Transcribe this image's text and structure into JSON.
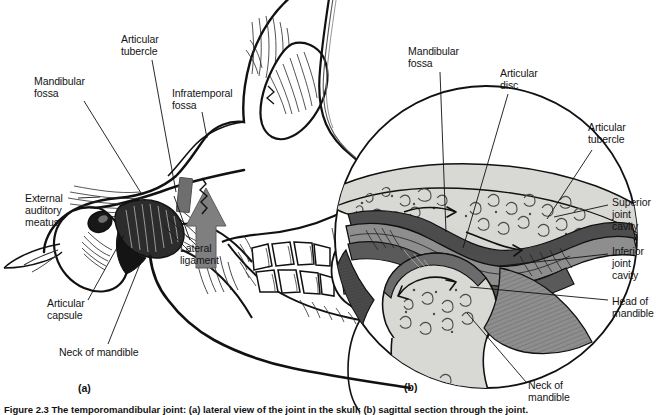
{
  "figure": {
    "caption": "Figure 2.3  The temporomandibular joint: (a) lateral view of the joint in the skull; (b) sagittal section through the joint.",
    "panels": [
      {
        "id": "(a)",
        "name": "lateral-view-of-temporomandibular-joint",
        "id_x": 78,
        "id_y": 382,
        "labels": [
          {
            "text": "Articular\ntubercle",
            "x": 121,
            "y": 34,
            "leader": [
              [
                152,
                60
              ],
              [
                176,
                192
              ]
            ]
          },
          {
            "text": "Mandibular\nfossa",
            "x": 34,
            "y": 76,
            "leader": [
              [
                84,
                101
              ],
              [
                141,
                193
              ]
            ]
          },
          {
            "text": "Infratemporal\nfossa",
            "x": 172,
            "y": 88,
            "leader": [
              [
                202,
                112
              ],
              [
                207,
                138
              ]
            ]
          },
          {
            "text": "External\nauditory\nmeatus",
            "x": 25,
            "y": 193,
            "leader": [
              [
                78,
                198
              ],
              [
                100,
                197
              ]
            ]
          },
          {
            "text": "Lateral\nligament",
            "x": 180,
            "y": 243,
            "leader": [
              [
                190,
                240
              ],
              [
                174,
                196
              ]
            ]
          },
          {
            "text": "Articular\ncapsule",
            "x": 47,
            "y": 298,
            "leader": [
              [
                88,
                300
              ],
              [
                124,
                235
              ]
            ]
          },
          {
            "text": "Neck of mandible",
            "x": 59,
            "y": 347,
            "leader": [
              [
                108,
                344
              ],
              [
                144,
                254
              ]
            ]
          }
        ],
        "arrow": {
          "name": "upward-direction-arrow",
          "color": "#7f7f7f"
        },
        "shaded_block": {
          "name": "lateral-ligament-marker-block",
          "color": "#6e6e6e"
        }
      },
      {
        "id": "(b)",
        "name": "sagittal-section-through-joint",
        "id_x": 404,
        "id_y": 381,
        "labels": [
          {
            "text": "Mandibular\nfossa",
            "x": 408,
            "y": 46,
            "leader": [
              [
                440,
                72
              ],
              [
                446,
                232
              ]
            ]
          },
          {
            "text": "Articular\ndisc",
            "x": 500,
            "y": 68,
            "leader": [
              [
                508,
                94
              ],
              [
                463,
                248
              ]
            ]
          },
          {
            "text": "Articular\ntubercle",
            "x": 588,
            "y": 122,
            "leader": [
              [
                592,
                150
              ],
              [
                547,
                219
              ]
            ]
          },
          {
            "text": "Superior\njoint\ncavity",
            "x": 612,
            "y": 197,
            "leader": [
              [
                608,
                205
              ],
              [
                554,
                217
              ]
            ]
          },
          {
            "text": "Inferior\njoint\ncavity",
            "x": 612,
            "y": 246,
            "leader": [
              [
                608,
                254
              ],
              [
                500,
                266
              ]
            ]
          },
          {
            "text": "Head of\nmandible",
            "x": 612,
            "y": 296,
            "leader": [
              [
                608,
                300
              ],
              [
                470,
                287
              ]
            ]
          },
          {
            "text": "Neck of\nmandible",
            "x": 528,
            "y": 380,
            "leader": [
              [
                526,
                382
              ],
              [
                467,
                313
              ]
            ]
          }
        ],
        "motion_arrows": [
          {
            "name": "superior-cavity-glide-arrow"
          },
          {
            "name": "disc-translation-arrow"
          },
          {
            "name": "inferior-cavity-rotation-arrow"
          }
        ]
      }
    ],
    "palette": {
      "ink": "#111111",
      "bone_light": "#d8d8d4",
      "bone_mid": "#b4b4b0",
      "disc_mid": "#8e8e8e",
      "cavity_dark": "#5a5a5a",
      "cavity_darker": "#3d3d3d",
      "arrow_gray": "#7f7f7f"
    }
  }
}
